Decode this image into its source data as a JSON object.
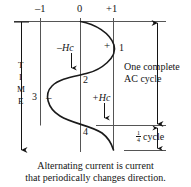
{
  "figure": {
    "title_caption_line1": "Alternating current is current",
    "title_caption_line2": "that periodically changes direction.",
    "axis": {
      "tick_labels": [
        "–1",
        "0",
        "+1"
      ],
      "vertical_axis_label_letters": [
        "T",
        "I",
        "M",
        "E"
      ],
      "vertical_axis_label": "TIME"
    },
    "curve_markers": {
      "point1": "1",
      "point2": "2",
      "point3": "3",
      "point4": "4",
      "plus_sign": "+",
      "minus_sign": "–"
    },
    "field_labels": {
      "negative_hc": "–Hc",
      "positive_hc": "+Hc"
    },
    "annotations": {
      "full_cycle_line1": "One complete",
      "full_cycle_line2": "AC cycle",
      "quarter_cycle_numerator": "1",
      "quarter_cycle_denominator": "4",
      "quarter_cycle_word": "cycle"
    },
    "colors": {
      "ink": "#141414",
      "rule": "#555555",
      "curve": "#1a1a1a",
      "background": "#ffffff"
    }
  }
}
